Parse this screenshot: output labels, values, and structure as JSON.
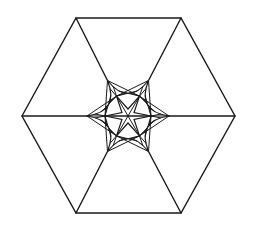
{
  "document": {
    "title": "Hexagonal star tessellation line drawing",
    "background_color": "#ffffff",
    "stroke_color": "#1a1a1a",
    "width": 253,
    "height": 231
  },
  "figure": {
    "name": "hexagon-star-figure",
    "center": {
      "x": 128,
      "y": 116
    },
    "stroke_width_outer": 1.4,
    "stroke_width_inner": 1.2,
    "stroke_width_fan": 1.0,
    "outer_hexagon": {
      "name": "outer-hexagon",
      "vertices": [
        {
          "label": "left",
          "x": 22,
          "y": 116
        },
        {
          "label": "top-left",
          "x": 76,
          "y": 18
        },
        {
          "label": "top-right",
          "x": 181,
          "y": 18
        },
        {
          "label": "right",
          "x": 235,
          "y": 116
        },
        {
          "label": "bottom-right",
          "x": 181,
          "y": 213
        },
        {
          "label": "bottom-left",
          "x": 76,
          "y": 213
        }
      ]
    },
    "inner_star": {
      "name": "inner-concave-hexagon",
      "tip_radius": 41,
      "arc_sag": 13,
      "tips": [
        {
          "label": "tip-left",
          "x": 87,
          "y": 116
        },
        {
          "label": "tip-upper-left",
          "x": 107.5,
          "y": 80.5
        },
        {
          "label": "tip-upper-right",
          "x": 148.5,
          "y": 80.5
        },
        {
          "label": "tip-right",
          "x": 169,
          "y": 116
        },
        {
          "label": "tip-lower-right",
          "x": 148.5,
          "y": 151.5
        },
        {
          "label": "tip-lower-left",
          "x": 107.5,
          "y": 151.5
        }
      ]
    },
    "fan_nodes": {
      "name": "fan-convergence-nodes",
      "count": 6,
      "node_radius": 23,
      "rays_per_node": 7
    },
    "core_star": {
      "name": "six-point-core-star",
      "points": 6,
      "outer_radius": 23,
      "inner_radius": 7
    },
    "connectors": {
      "name": "vertex-connectors",
      "description": "Lines from outer hexagon vertices to inner star tips",
      "count": 6
    }
  }
}
